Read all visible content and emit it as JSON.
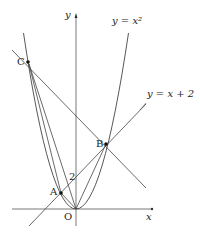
{
  "diagram": {
    "axes": {
      "x_label": "x",
      "y_label": "y",
      "origin_label": "O"
    },
    "curves": [
      {
        "name": "parabola",
        "label": "y = x²",
        "equation": "y = x^2"
      },
      {
        "name": "line",
        "label": "y = x + 2",
        "equation": "y = x + 2"
      }
    ],
    "points": [
      {
        "label": "A",
        "x": -1,
        "y": 1
      },
      {
        "label": "B",
        "x": 2,
        "y": 4
      },
      {
        "label": "C",
        "x": -3,
        "y": 9
      }
    ],
    "y_intercept_label": "2",
    "colors": {
      "stroke": "#333333",
      "background": "#ffffff"
    }
  }
}
